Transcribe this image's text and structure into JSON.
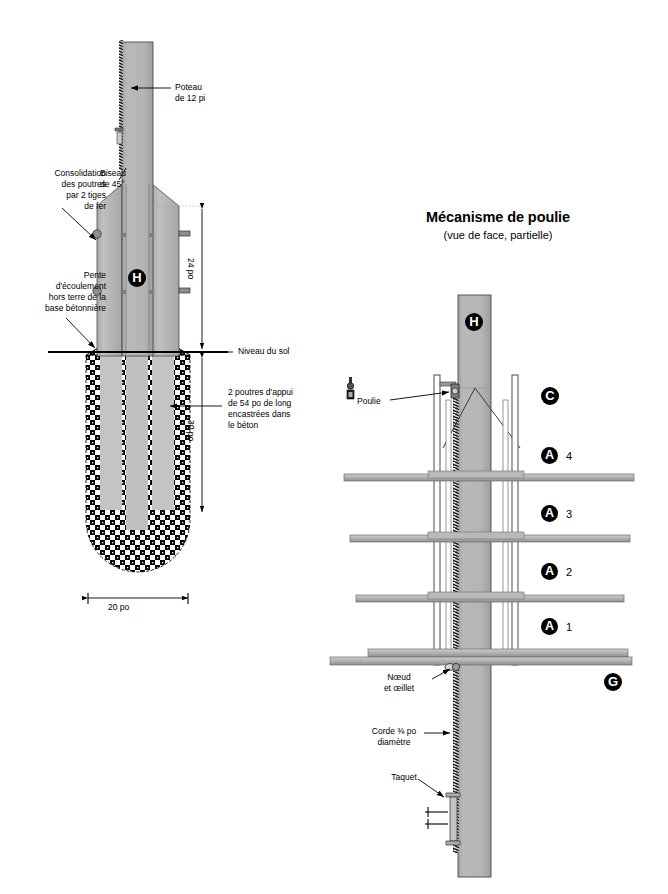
{
  "figure": {
    "language": "fr",
    "kind": "technical-diagram",
    "background_color": "#ffffff",
    "ink_color": "#000000"
  },
  "colors": {
    "post_fill": "#b0b0b0",
    "post_fill_light": "#bdbdbd",
    "beam_fill": "#bcbcbc",
    "shelf_fill": "#b5b5b5",
    "shelf_edge": "#6e6e6e",
    "concrete_dark": "#000000",
    "concrete_light": "#ffffff",
    "outline": "#3a3a3a",
    "leader": "#000000",
    "marker_bg": "#000000",
    "marker_fg": "#ffffff"
  },
  "left_diagram": {
    "name": "coupe-fondation-poteau",
    "labels": {
      "post": "Poteau\nde 12 pi",
      "bevel": "Biseau\nde 45°",
      "rods": "Consolidation\ndes poutres\npar 2 tiges\nde fer",
      "slope": "Pente\nd'écoulement\nhors terre de la\nbase bétonnière",
      "ground_level": "Niveau du sol",
      "beams": "2 poutres d'appui\nde 54 po de long\nencastrées dans\nle béton"
    },
    "markers": [
      {
        "id": "H",
        "glyph": "H",
        "name": "marker-h-post"
      }
    ],
    "dimensions": [
      {
        "id": "above-ground",
        "value": "24 po",
        "orientation": "vertical",
        "measures": "hauteur hors sol des poutres"
      },
      {
        "id": "below-ground",
        "value": "30 po",
        "orientation": "vertical",
        "measures": "profondeur de la base de béton"
      },
      {
        "id": "base-width",
        "value": "20 po",
        "orientation": "horizontal",
        "measures": "largeur de la base de béton"
      }
    ]
  },
  "right_diagram": {
    "name": "mecanisme-de-poulie",
    "title": "Mécanisme de poulie",
    "subtitle": "(vue de face, partielle)",
    "labels": {
      "pulley": "Poulie",
      "knot": "Nœud\net œillet",
      "rope": "Corde ⅜ po\ndiamètre",
      "cleat": "Taquet"
    },
    "markers": [
      {
        "id": "H",
        "glyph": "H",
        "number": "",
        "name": "marker-h-post"
      },
      {
        "id": "C",
        "glyph": "C",
        "number": "",
        "name": "marker-c-rail"
      },
      {
        "id": "A4",
        "glyph": "A",
        "number": "4",
        "name": "marker-a-level-4"
      },
      {
        "id": "A3",
        "glyph": "A",
        "number": "3",
        "name": "marker-a-level-3"
      },
      {
        "id": "A2",
        "glyph": "A",
        "number": "2",
        "name": "marker-a-level-2"
      },
      {
        "id": "A1",
        "glyph": "A",
        "number": "1",
        "name": "marker-a-level-1"
      },
      {
        "id": "G",
        "glyph": "G",
        "number": "",
        "name": "marker-g-base-platform"
      }
    ]
  }
}
